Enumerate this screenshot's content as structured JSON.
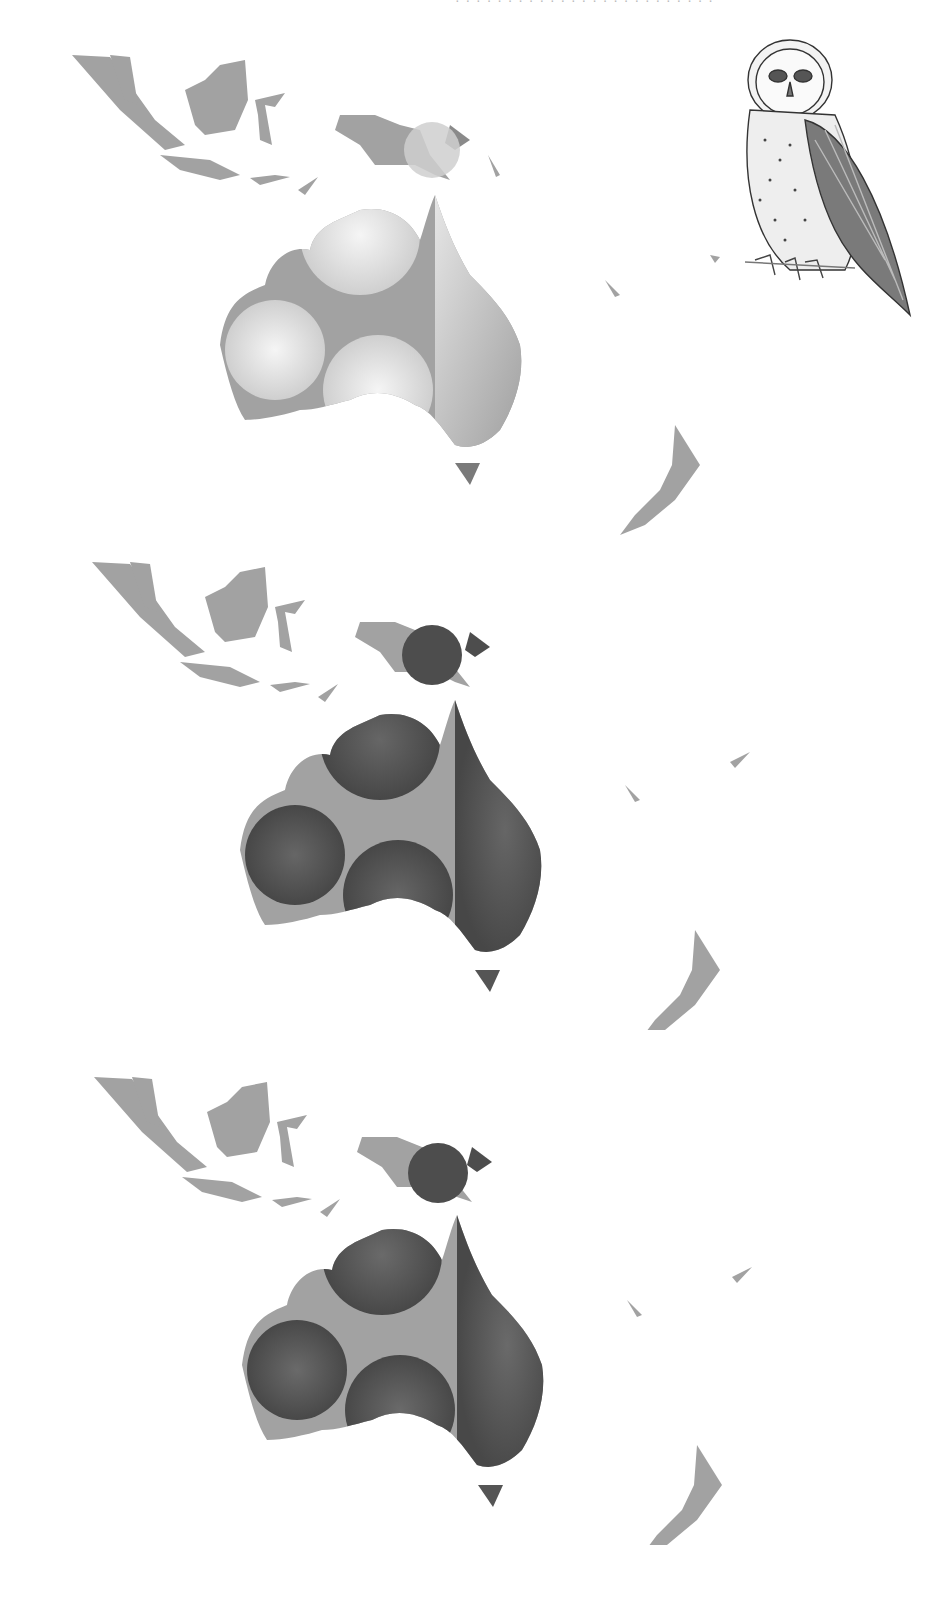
{
  "header": {
    "text": "· · · · · · · ·   · · · · · · · · · · · · · ·      · · ·"
  },
  "colors": {
    "land": "#a2a2a2",
    "predicted_dark": "#4d4d4d",
    "predicted_light": "#d6d6d6",
    "background": "#ffffff"
  },
  "maps": [
    {
      "id": "panel-1",
      "label": "Distribution model panel 1 (light gradient)",
      "style": "light"
    },
    {
      "id": "panel-2",
      "label": "Distribution model panel 2 (dark)",
      "style": "dark"
    },
    {
      "id": "panel-3",
      "label": "Distribution model panel 3 (dark)",
      "style": "dark"
    }
  ],
  "regions": [
    "Sumatra",
    "Borneo",
    "Sulawesi",
    "Java",
    "New Guinea",
    "Australia",
    "Tasmania",
    "New Zealand"
  ],
  "illustration": {
    "subject": "Barn owl sketch"
  }
}
